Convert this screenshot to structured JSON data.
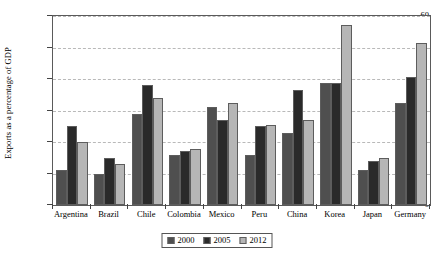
{
  "chart_data": {
    "type": "bar",
    "title": "",
    "xlabel": "",
    "ylabel": "Exports as a percentage of GDP",
    "ylim": [
      0,
      60
    ],
    "yticks": [
      0,
      10,
      20,
      30,
      40,
      50,
      60
    ],
    "grid": true,
    "legend_position": "bottom-center",
    "categories": [
      "Argentina",
      "Brazil",
      "Chile",
      "Colombia",
      "Mexico",
      "Peru",
      "China",
      "Korea",
      "Japan",
      "Germany"
    ],
    "series": [
      {
        "name": "2000",
        "color": "#4f4f4f",
        "values": [
          11,
          10,
          29,
          16,
          31,
          16,
          23,
          38.8,
          11,
          32.5
        ]
      },
      {
        "name": "2005",
        "color": "#2a2a2a",
        "values": [
          25,
          15,
          38,
          17,
          27,
          25,
          36.5,
          38.8,
          14,
          40.5
        ]
      },
      {
        "name": "2012",
        "color": "#b6b6b6",
        "values": [
          20,
          13,
          34,
          17.8,
          32.5,
          25.5,
          27,
          57,
          15,
          51.5
        ]
      }
    ]
  },
  "legend": {
    "items": [
      {
        "label": "2000"
      },
      {
        "label": "2005"
      },
      {
        "label": "2012"
      }
    ]
  }
}
